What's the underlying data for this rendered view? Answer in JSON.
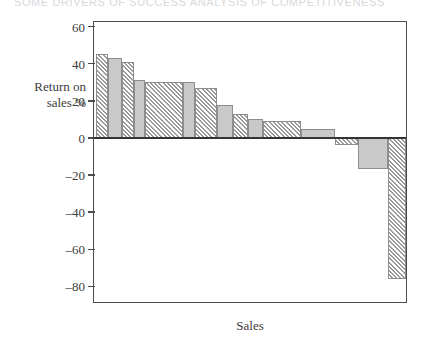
{
  "header": {
    "cutoff_text": "SOME DRIVERS OF SUCCESS  ANALYSIS OF COMPETITIVENESS"
  },
  "axis": {
    "y_title_line1": "Return on",
    "y_title_line2": "sales %",
    "x_title": "Sales",
    "y_ticks": [
      "60",
      "40",
      "20",
      "0",
      "–20",
      "–40",
      "–60",
      "–80"
    ]
  },
  "colors": {
    "solid_fill": "#c9c9c9",
    "hatch_fill": "#e6e6e6",
    "hatch_stroke": "#9a9a9a",
    "bar_border": "#8d8d8d",
    "frame": "#4c4c4c",
    "zero_line": "#343434",
    "text": "#3c3c3c"
  },
  "chart_data": {
    "type": "bar",
    "title": "",
    "subtitle": "",
    "xlabel": "Sales",
    "ylabel": "Return on sales %",
    "ylim": [
      -90,
      65
    ],
    "yticks": [
      60,
      40,
      20,
      0,
      -20,
      -40,
      -60,
      -80
    ],
    "grid": false,
    "legend": "none",
    "orientation": "vertical",
    "note": "Variable-width (Marimekko style) waterfall-ordered bar chart; bar width is proportional to sales, bar height is return on sales %. Fill alternates between solid grey and diagonal hatch to separate adjacent segments.",
    "categories": [
      "1",
      "2",
      "3",
      "4",
      "5",
      "6",
      "7",
      "8",
      "9",
      "10",
      "11",
      "12",
      "13",
      "14",
      "15"
    ],
    "values": [
      45,
      43,
      41,
      31,
      30,
      30,
      27,
      18,
      13,
      10,
      9,
      5,
      -4,
      -17,
      -76
    ],
    "widths": [
      10,
      12,
      10,
      9,
      32,
      10,
      19,
      13,
      13,
      13,
      32,
      28,
      20,
      25,
      15
    ],
    "fills": [
      "hatch",
      "solid",
      "hatch",
      "solid",
      "hatch",
      "solid",
      "hatch",
      "solid",
      "hatch",
      "solid",
      "hatch",
      "solid",
      "hatch",
      "solid",
      "hatch",
      "solid"
    ]
  }
}
